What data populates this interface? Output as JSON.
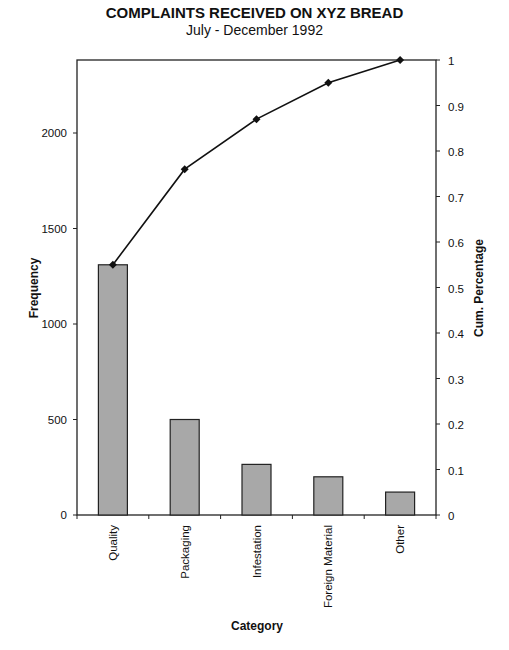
{
  "chart_data": {
    "type": "bar+line (pareto)",
    "title": "COMPLAINTS RECEIVED ON XYZ BREAD",
    "subtitle": "July - December 1992",
    "xlabel": "Category",
    "ylabel": "Frequency",
    "y2label": "Cum. Percentage",
    "categories": [
      "Quality",
      "Packaging",
      "Infestation",
      "Foreign Material",
      "Other"
    ],
    "series": [
      {
        "name": "Frequency",
        "type": "bar",
        "axis": "left",
        "values": [
          1310,
          500,
          265,
          200,
          120
        ],
        "color": "#a8a8a8"
      },
      {
        "name": "Cum. Percentage",
        "type": "line",
        "axis": "right",
        "values": [
          0.55,
          0.76,
          0.87,
          0.95,
          1.0
        ],
        "color": "#111111",
        "marker": "diamond"
      }
    ],
    "ylim": [
      0,
      2400
    ],
    "yticks": [
      "0",
      "500",
      "1000",
      "1500",
      "2000"
    ],
    "y2lim": [
      0,
      1
    ],
    "y2ticks": [
      "0",
      "0.1",
      "0.2",
      "0.3",
      "0.4",
      "0.5",
      "0.6",
      "0.7",
      "0.8",
      "0.9",
      "1"
    ],
    "grid": false,
    "legend": "none"
  }
}
